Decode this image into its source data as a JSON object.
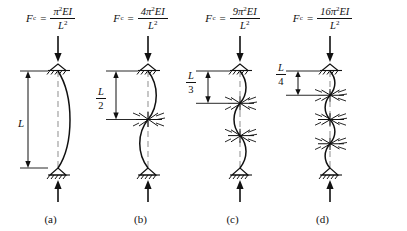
{
  "figure": {
    "background_color": "#ffffff",
    "line_color": "#111111",
    "dashed_color": "#888888"
  },
  "panels": [
    {
      "caption": "(a)",
      "formula": {
        "symbol": "F",
        "subscript": "c",
        "equals": "=",
        "numerator_coefficient": "",
        "numerator": "π",
        "numerator_exponent": "2",
        "numerator_terms": "EI",
        "denominator": "L",
        "denominator_exponent": "2",
        "text": "Fc = π2EI / L2"
      },
      "dimension_label": {
        "type": "plain",
        "value": "L",
        "numerator": "L",
        "denominator": ""
      },
      "intermediate_braces": 0,
      "buckle_half_waves": 1,
      "effective_length": "L"
    },
    {
      "caption": "(b)",
      "formula": {
        "symbol": "F",
        "subscript": "c",
        "equals": "=",
        "numerator_coefficient": "4",
        "numerator": "π",
        "numerator_exponent": "2",
        "numerator_terms": "EI",
        "denominator": "L",
        "denominator_exponent": "2",
        "text": "Fc = 4π2EI / L2"
      },
      "dimension_label": {
        "type": "fraction",
        "value": "L/2",
        "numerator": "L",
        "denominator": "2"
      },
      "intermediate_braces": 1,
      "buckle_half_waves": 2,
      "effective_length": "L/2"
    },
    {
      "caption": "(c)",
      "formula": {
        "symbol": "F",
        "subscript": "c",
        "equals": "=",
        "numerator_coefficient": "9",
        "numerator": "π",
        "numerator_exponent": "2",
        "numerator_terms": "EI",
        "denominator": "L",
        "denominator_exponent": "2",
        "text": "Fc = 9π2EI / L2"
      },
      "dimension_label": {
        "type": "fraction",
        "value": "L/3",
        "numerator": "L",
        "denominator": "3"
      },
      "intermediate_braces": 2,
      "buckle_half_waves": 3,
      "effective_length": "L/3"
    },
    {
      "caption": "(d)",
      "formula": {
        "symbol": "F",
        "subscript": "c",
        "equals": "=",
        "numerator_coefficient": "16",
        "numerator": "π",
        "numerator_exponent": "2",
        "numerator_terms": "EI",
        "denominator": "L",
        "denominator_exponent": "2",
        "text": "Fc = 16π2EI / L2"
      },
      "dimension_label": {
        "type": "fraction",
        "value": "L/4",
        "numerator": "L",
        "denominator": "4"
      },
      "intermediate_braces": 3,
      "buckle_half_waves": 4,
      "effective_length": "L/4"
    }
  ]
}
